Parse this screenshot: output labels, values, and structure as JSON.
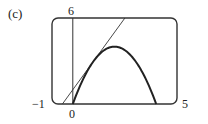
{
  "panel_label": "(c)",
  "chart_data": {
    "type": "line",
    "title": "",
    "xlabel": "",
    "ylabel": "",
    "xlim": [
      -1,
      5
    ],
    "ylim": [
      0,
      6
    ],
    "grid": false,
    "legend": null,
    "tick_labels": {
      "x_min": "−1",
      "x_max": "5",
      "y_max": "6",
      "origin": "0"
    },
    "series": [
      {
        "name": "f(x) = x(4 − x)",
        "style": "thick",
        "x": [
          0,
          0.5,
          1,
          1.5,
          2,
          2.5,
          3,
          3.5,
          4
        ],
        "y": [
          0,
          1.75,
          3,
          3.75,
          4,
          3.75,
          3,
          1.75,
          0
        ]
      },
      {
        "name": "tangent at x = 1: y = 2x + 1",
        "style": "thin",
        "x": [
          -0.5,
          2.5
        ],
        "y": [
          0,
          6
        ]
      }
    ]
  }
}
